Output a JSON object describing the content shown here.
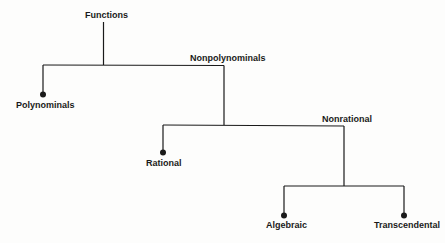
{
  "diagram": {
    "title": "Functions",
    "nodes": {
      "root": "Functions",
      "nonpolynominals": "Nonpolynominals",
      "polynominals": "Polynominals",
      "rational": "Rational",
      "nonrational": "Nonrational",
      "algebraic": "Algebraic",
      "transcendental": "Transcendental"
    },
    "edges": [
      [
        "Functions",
        "Polynominals"
      ],
      [
        "Functions",
        "Nonpolynominals"
      ],
      [
        "Nonpolynominals",
        "Rational"
      ],
      [
        "Nonpolynominals",
        "Nonrational"
      ],
      [
        "Nonrational",
        "Algebraic"
      ],
      [
        "Nonrational",
        "Transcendental"
      ]
    ],
    "colors": {
      "line": "#1a1a1a",
      "background": "#fdfdfc"
    }
  }
}
